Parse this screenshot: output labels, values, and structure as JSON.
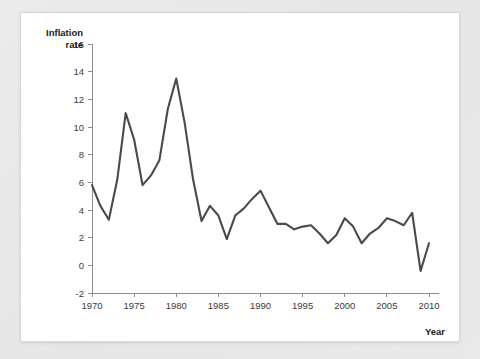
{
  "page": {
    "background_color": "#e8e8e8",
    "panel_color": "#ffffff"
  },
  "chart_data": {
    "type": "line",
    "title": "",
    "subtitle": "",
    "xlabel": "Year",
    "ylabel": "Inflation rate",
    "ylabel_line1": "Inflation",
    "ylabel_line2": "rate",
    "xlim": [
      1970,
      2010
    ],
    "ylim": [
      -2,
      16
    ],
    "xticks": [
      1970,
      1975,
      1980,
      1985,
      1990,
      1995,
      2000,
      2005,
      2010
    ],
    "xtick_labels": [
      "1970",
      "1975",
      "1980",
      "1985",
      "1990",
      "1995",
      "2000",
      "2005",
      "2010"
    ],
    "yticks": [
      -2,
      0,
      2,
      4,
      6,
      8,
      10,
      12,
      14,
      16
    ],
    "ytick_labels": [
      "-2",
      "0",
      "2",
      "4",
      "6",
      "8",
      "10",
      "12",
      "14",
      "16"
    ],
    "grid": false,
    "legend": false,
    "legend_position": "none",
    "line_color": "#4a4a4a",
    "axis_color": "#8d8d8d",
    "x": [
      1970,
      1971,
      1972,
      1973,
      1974,
      1975,
      1976,
      1977,
      1978,
      1979,
      1980,
      1981,
      1982,
      1983,
      1984,
      1985,
      1986,
      1987,
      1988,
      1989,
      1990,
      1991,
      1992,
      1993,
      1994,
      1995,
      1996,
      1997,
      1998,
      1999,
      2000,
      2001,
      2002,
      2003,
      2004,
      2005,
      2006,
      2007,
      2008,
      2009
    ],
    "values": [
      5.8,
      4.3,
      3.3,
      6.2,
      11.0,
      9.1,
      5.8,
      6.5,
      7.6,
      11.3,
      13.5,
      10.3,
      6.2,
      3.2,
      4.3,
      3.6,
      1.9,
      3.6,
      4.1,
      4.8,
      5.4,
      4.2,
      3.0,
      3.0,
      2.6,
      2.8,
      2.9,
      2.3,
      1.6,
      2.2,
      3.4,
      2.8,
      1.6,
      2.3,
      2.7,
      3.4,
      3.2,
      2.9,
      3.8,
      -0.4
    ],
    "end_point": {
      "x": 2010,
      "value": 1.6
    },
    "series": [
      {
        "name": "Inflation rate",
        "values": [
          5.8,
          4.3,
          3.3,
          6.2,
          11.0,
          9.1,
          5.8,
          6.5,
          7.6,
          11.3,
          13.5,
          10.3,
          6.2,
          3.2,
          4.3,
          3.6,
          1.9,
          3.6,
          4.1,
          4.8,
          5.4,
          4.2,
          3.0,
          3.0,
          2.6,
          2.8,
          2.9,
          2.3,
          1.6,
          2.2,
          3.4,
          2.8,
          1.6,
          2.3,
          2.7,
          3.4,
          3.2,
          2.9,
          3.8,
          -0.4
        ]
      }
    ]
  }
}
